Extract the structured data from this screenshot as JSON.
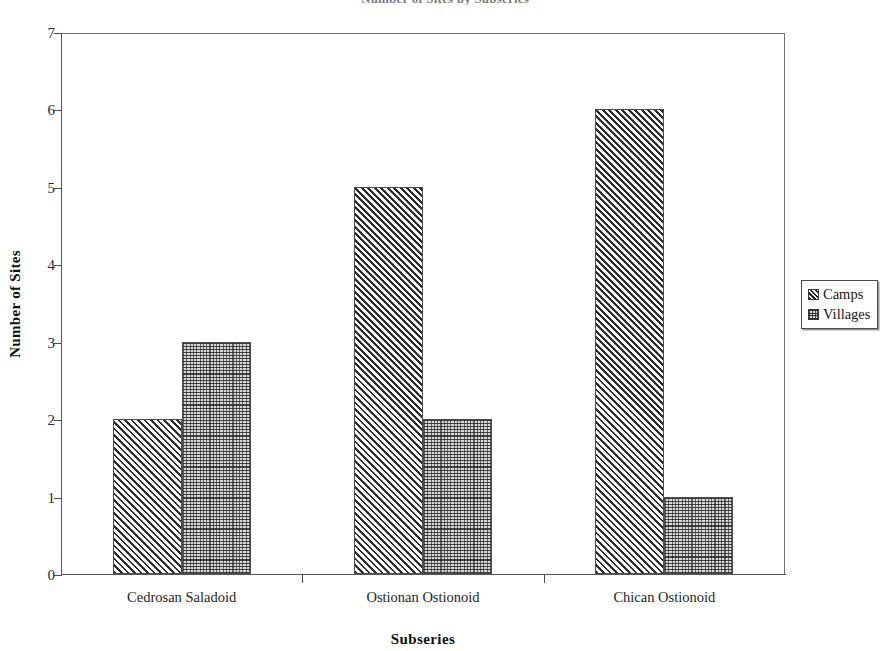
{
  "figure": {
    "title_cropped": "Number of Sites by Subseries",
    "width": 890,
    "height": 651
  },
  "chart_data": {
    "type": "bar",
    "title": "Number of Sites by Subseries",
    "subtitle": "",
    "categories": [
      "Cedrosan Saladoid",
      "Ostionan Ostionoid",
      "Chican Ostionoid"
    ],
    "series": [
      {
        "name": "Camps",
        "values": [
          2,
          5,
          6
        ],
        "pattern": "diagonal-hatch",
        "color": "#2b2b2b"
      },
      {
        "name": "Villages",
        "values": [
          3,
          2,
          1
        ],
        "pattern": "stipple-dot",
        "color": "#d9d9d9"
      }
    ],
    "xlabel": "Subseries",
    "ylabel": "Number of Sites",
    "ylim": [
      0,
      7
    ],
    "yticks": [
      0,
      1,
      2,
      3,
      4,
      5,
      6,
      7
    ],
    "ytick_labels": [
      "0",
      "1",
      "2",
      "3",
      "4",
      "5",
      "6",
      "7"
    ],
    "grid": false,
    "legend_position": "right-outside",
    "legend_entries": [
      "Camps",
      "Villages"
    ],
    "bar_grouping": "clustered-adjacent"
  },
  "axes": {
    "y": {
      "title": "Number of Sites",
      "ticks": [
        {
          "value": 7,
          "label": "7"
        },
        {
          "value": 6,
          "label": "6"
        },
        {
          "value": 5,
          "label": "5"
        },
        {
          "value": 4,
          "label": "4"
        },
        {
          "value": 3,
          "label": "3"
        },
        {
          "value": 2,
          "label": "2"
        },
        {
          "value": 1,
          "label": "1"
        },
        {
          "value": 0,
          "label": "0"
        }
      ]
    },
    "x": {
      "title": "Subseries",
      "categories": [
        {
          "label": "Cedrosan Saladoid"
        },
        {
          "label": "Ostionan Ostionoid"
        },
        {
          "label": "Chican Ostionoid"
        }
      ]
    }
  },
  "legend": {
    "items": [
      {
        "label": "Camps",
        "swatch": "hatch-swatch-icon"
      },
      {
        "label": "Villages",
        "swatch": "stipple-swatch-icon"
      }
    ]
  },
  "bars": [
    {
      "group": "Cedrosan Saladoid",
      "series": "Camps",
      "value": 2
    },
    {
      "group": "Cedrosan Saladoid",
      "series": "Villages",
      "value": 3
    },
    {
      "group": "Ostionan Ostionoid",
      "series": "Camps",
      "value": 5
    },
    {
      "group": "Ostionan Ostionoid",
      "series": "Villages",
      "value": 2
    },
    {
      "group": "Chican Ostionoid",
      "series": "Camps",
      "value": 6
    },
    {
      "group": "Chican Ostionoid",
      "series": "Villages",
      "value": 1
    }
  ]
}
